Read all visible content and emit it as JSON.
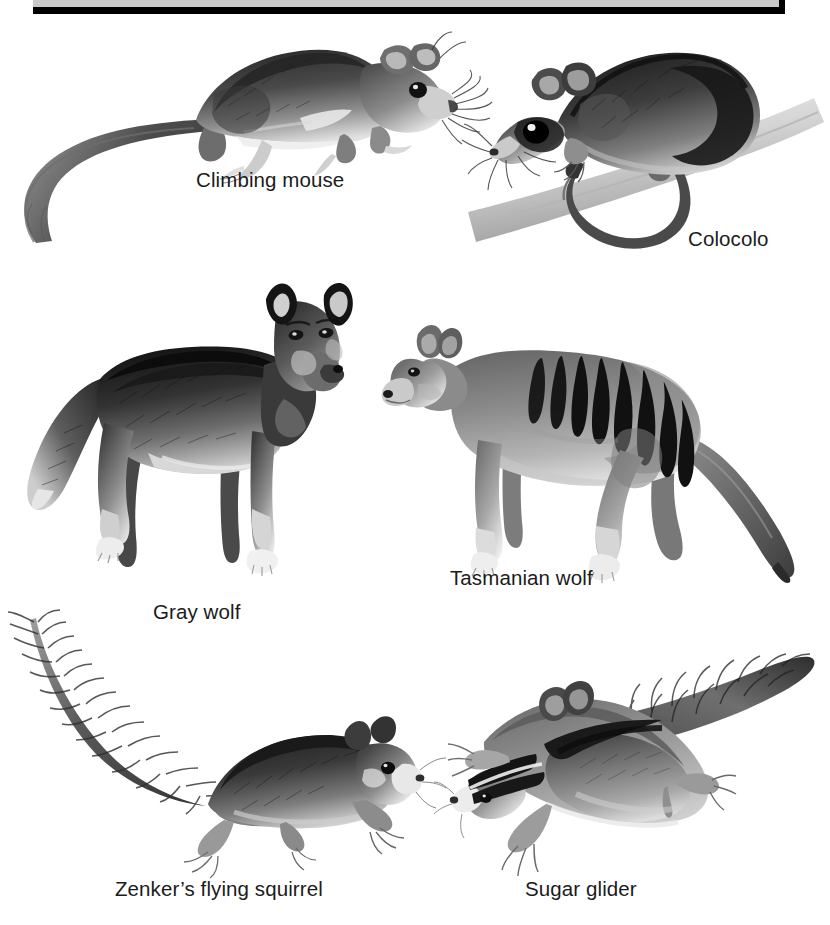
{
  "figure": {
    "background_color": "#ffffff",
    "ink_color": "#1b1b1b",
    "banner": {
      "fill_color": "#c9c9c9",
      "border_color": "#000000"
    },
    "style": "grayscale pencil illustration",
    "pairs": [
      {
        "placental": "Climbing mouse",
        "marsupial": "Colocolo"
      },
      {
        "placental": "Gray wolf",
        "marsupial": "Tasmanian wolf"
      },
      {
        "placental": "Zenker's flying squirrel",
        "marsupial": "Sugar glider"
      }
    ]
  },
  "captions": {
    "climbing_mouse": "Climbing mouse",
    "colocolo": "Colocolo",
    "gray_wolf": "Gray wolf",
    "tasmanian_wolf": "Tasmanian wolf",
    "zenkers_flying_squirrel": "Zenker’s flying squirrel",
    "sugar_glider": "Sugar glider"
  },
  "illustrations": {
    "climbing_mouse": "climbing-mouse-illustration",
    "colocolo": "colocolo-illustration",
    "gray_wolf": "gray-wolf-illustration",
    "tasmanian_wolf": "tasmanian-wolf-illustration",
    "zenkers_flying_squirrel": "zenkers-flying-squirrel-illustration",
    "sugar_glider": "sugar-glider-illustration"
  }
}
